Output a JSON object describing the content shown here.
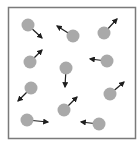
{
  "diagram": {
    "container": {
      "x": 8.5,
      "y": 7.5,
      "width": 127,
      "height": 131,
      "stroke": "#7a7a7a",
      "stroke_width": 1.5
    },
    "particle_style": {
      "radius": 6.5,
      "fill": "#a9a9a9",
      "arrow_color": "#1e1e1e",
      "arrow_width": 1.2
    },
    "particles": [
      {
        "id": 1,
        "cx": 28,
        "cy": 25,
        "vx": 42,
        "vy": 38,
        "direction": "down-right"
      },
      {
        "id": 2,
        "cx": 73,
        "cy": 36,
        "vx": 57,
        "vy": 26,
        "direction": "up-left"
      },
      {
        "id": 3,
        "cx": 104,
        "cy": 33,
        "vx": 117,
        "vy": 19,
        "direction": "up-right"
      },
      {
        "id": 4,
        "cx": 30,
        "cy": 62,
        "vx": 42,
        "vy": 50,
        "direction": "up-right"
      },
      {
        "id": 5,
        "cx": 66,
        "cy": 68,
        "vx": 65,
        "vy": 87,
        "direction": "down"
      },
      {
        "id": 6,
        "cx": 107,
        "cy": 61,
        "vx": 90,
        "vy": 59,
        "direction": "left"
      },
      {
        "id": 7,
        "cx": 31,
        "cy": 88,
        "vx": 18,
        "vy": 101,
        "direction": "down-left"
      },
      {
        "id": 8,
        "cx": 110,
        "cy": 94,
        "vx": 124,
        "vy": 82,
        "direction": "up-right"
      },
      {
        "id": 9,
        "cx": 64,
        "cy": 110,
        "vx": 77,
        "vy": 97,
        "direction": "up-right"
      },
      {
        "id": 10,
        "cx": 27,
        "cy": 120,
        "vx": 48,
        "vy": 122,
        "direction": "right"
      },
      {
        "id": 11,
        "cx": 99,
        "cy": 124,
        "vx": 81,
        "vy": 122,
        "direction": "left"
      }
    ]
  }
}
